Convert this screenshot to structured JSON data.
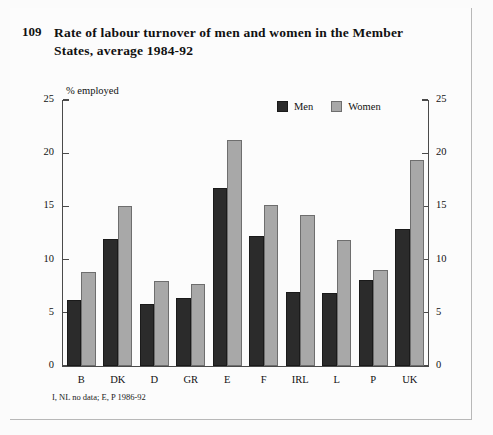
{
  "figure": {
    "number": "109",
    "title": "Rate of labour turnover of men and women in the Member States, average 1984-92",
    "footnote": "I, NL no data; E, P 1986-92"
  },
  "legend": {
    "position": "top-right",
    "entries": [
      {
        "label": "Men",
        "color": "#2b2b2b"
      },
      {
        "label": "Women",
        "color": "#a8a8a8"
      }
    ]
  },
  "axes": {
    "y_unit_label": "% employed",
    "y_ticks_left": [
      "25",
      "20",
      "15",
      "10",
      "5",
      "0"
    ],
    "y_ticks_right": [
      "25",
      "20",
      "15",
      "10",
      "5",
      "0"
    ]
  },
  "chart_data": {
    "type": "bar",
    "title": "Rate of labour turnover of men and women in the Member States, average 1984-92",
    "xlabel": "",
    "ylabel": "% employed",
    "ylim": [
      0,
      25
    ],
    "yticks": [
      0,
      5,
      10,
      15,
      20,
      25
    ],
    "grid": false,
    "legend_position": "top-right",
    "categories": [
      "B",
      "DK",
      "D",
      "GR",
      "E",
      "F",
      "IRL",
      "L",
      "P",
      "UK"
    ],
    "series": [
      {
        "name": "Men",
        "color": "#2b2b2b",
        "values": [
          6.2,
          11.9,
          5.8,
          6.4,
          16.7,
          12.2,
          7.0,
          6.9,
          8.1,
          12.9
        ]
      },
      {
        "name": "Women",
        "color": "#a8a8a8",
        "values": [
          8.8,
          15.0,
          8.0,
          7.7,
          21.2,
          15.1,
          14.2,
          11.8,
          9.0,
          19.4
        ]
      }
    ],
    "annotations": [
      "I, NL no data; E, P 1986-92"
    ]
  }
}
